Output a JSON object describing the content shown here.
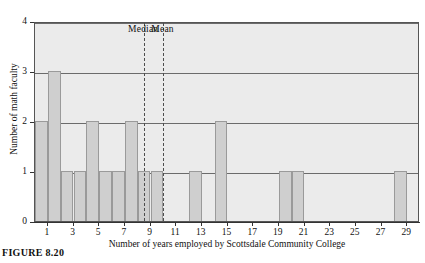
{
  "figure": {
    "caption": "FIGURE 8.20"
  },
  "chart_data": {
    "type": "bar",
    "title": "",
    "xlabel": "Number of years employed by Scottsdale Community College",
    "ylabel": "Number of math faculty",
    "xlim": [
      0,
      30
    ],
    "ylim": [
      0,
      4
    ],
    "bin_width": 1,
    "grid": true,
    "grid_axis": "y",
    "legend_position": "none",
    "xticks": [
      1,
      3,
      5,
      7,
      9,
      11,
      13,
      15,
      17,
      19,
      21,
      23,
      25,
      27,
      29
    ],
    "xtick_labels": [
      "1",
      "3",
      "5",
      "7",
      "9",
      "11",
      "13",
      "15",
      "17",
      "19",
      "21",
      "23",
      "25",
      "27",
      "29"
    ],
    "yticks": [
      0,
      1,
      2,
      3,
      4
    ],
    "ytick_labels": [
      "0",
      "1",
      "2",
      "3",
      "4"
    ],
    "bars": [
      {
        "bin_start": 0,
        "bin_end": 1,
        "value": 2
      },
      {
        "bin_start": 1,
        "bin_end": 2,
        "value": 3
      },
      {
        "bin_start": 2,
        "bin_end": 3,
        "value": 1
      },
      {
        "bin_start": 3,
        "bin_end": 4,
        "value": 1
      },
      {
        "bin_start": 4,
        "bin_end": 5,
        "value": 2
      },
      {
        "bin_start": 5,
        "bin_end": 6,
        "value": 1
      },
      {
        "bin_start": 6,
        "bin_end": 7,
        "value": 1
      },
      {
        "bin_start": 7,
        "bin_end": 8,
        "value": 2
      },
      {
        "bin_start": 8,
        "bin_end": 9,
        "value": 1
      },
      {
        "bin_start": 9,
        "bin_end": 10,
        "value": 1
      },
      {
        "bin_start": 12,
        "bin_end": 13,
        "value": 1
      },
      {
        "bin_start": 14,
        "bin_end": 15,
        "value": 2
      },
      {
        "bin_start": 19,
        "bin_end": 20,
        "value": 1
      },
      {
        "bin_start": 20,
        "bin_end": 21,
        "value": 1
      },
      {
        "bin_start": 28,
        "bin_end": 29,
        "value": 1
      }
    ],
    "annotations": [
      {
        "name": "median",
        "label": "Median",
        "x": 8.5,
        "style": "dashed-vertical"
      },
      {
        "name": "mean",
        "label": "Mean",
        "x": 10.0,
        "style": "dashed-vertical"
      }
    ],
    "colors": {
      "bar_fill": "#cfcfcf",
      "bar_edge": "#9a9a9a",
      "plot_background": "#ebebeb",
      "grid": "#6b6b6b",
      "axis": "#333333",
      "annotation_line": "#4d4d4d"
    }
  }
}
